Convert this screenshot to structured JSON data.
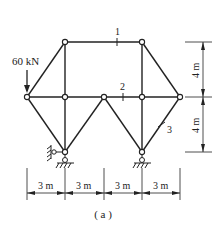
{
  "figure": {
    "caption": "( a )",
    "load": {
      "label": "60 kN",
      "node": "A"
    },
    "member_labels": [
      {
        "id": "1",
        "label": "1"
      },
      {
        "id": "2",
        "label": "2"
      },
      {
        "id": "3",
        "label": "3"
      }
    ],
    "dimensions": {
      "horizontal": [
        "3 m",
        "3 m",
        "3 m",
        "3 m"
      ],
      "vertical": [
        "4 m",
        "4 m"
      ]
    },
    "colors": {
      "line": "#222222",
      "background": "#ffffff"
    }
  }
}
